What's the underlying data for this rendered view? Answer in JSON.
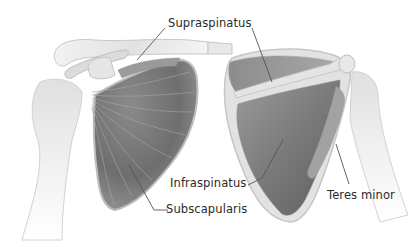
{
  "figure": {
    "views": [
      {
        "id": "anterior",
        "description": "anterior view of left shoulder"
      },
      {
        "id": "posterior",
        "description": "posterior view of right shoulder"
      }
    ]
  },
  "labels": {
    "supraspinatus": "Supraspinatus",
    "infraspinatus": "Infraspinatus",
    "subscapularis": "Subscapularis",
    "teres_minor": "Teres minor"
  },
  "colors": {
    "background": "#ffffff",
    "bone": "#e4e4e4",
    "bone_edge": "#c8c8c8",
    "muscle_dark": "#6a6a6a",
    "muscle_mid": "#8e8e8e",
    "leader_line": "#555555",
    "text": "#2a2a2a"
  }
}
